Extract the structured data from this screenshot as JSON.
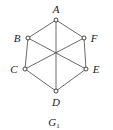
{
  "diagram": {
    "type": "graph",
    "caption": {
      "main": "G",
      "subscript": "1"
    },
    "nodes": [
      {
        "id": "A",
        "label": "A",
        "x": 56,
        "y": 20,
        "lx": 56,
        "ly": 13
      },
      {
        "id": "B",
        "label": "B",
        "x": 28,
        "y": 38,
        "lx": 17,
        "ly": 42
      },
      {
        "id": "C",
        "label": "C",
        "x": 25,
        "y": 69,
        "lx": 14,
        "ly": 73
      },
      {
        "id": "D",
        "label": "D",
        "x": 56,
        "y": 91,
        "lx": 56,
        "ly": 106
      },
      {
        "id": "E",
        "label": "E",
        "x": 86,
        "y": 69,
        "lx": 96,
        "ly": 73
      },
      {
        "id": "F",
        "label": "F",
        "x": 84,
        "y": 38,
        "lx": 94,
        "ly": 42
      }
    ],
    "edges": [
      [
        "A",
        "B"
      ],
      [
        "B",
        "C"
      ],
      [
        "C",
        "D"
      ],
      [
        "D",
        "E"
      ],
      [
        "E",
        "F"
      ],
      [
        "F",
        "A"
      ],
      [
        "A",
        "D"
      ],
      [
        "B",
        "E"
      ],
      [
        "C",
        "F"
      ]
    ]
  }
}
